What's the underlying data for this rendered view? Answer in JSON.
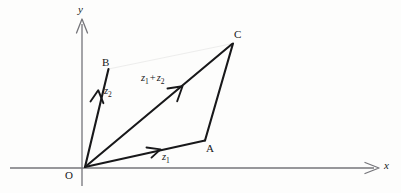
{
  "figure": {
    "kind": "vector-addition-parallelogram-diagram",
    "background_color": "#fdfdfc",
    "ink_color": "#18181a",
    "axis_color": "#6e6e70"
  },
  "axes": {
    "x_label": "x",
    "y_label": "y",
    "origin_label": "O",
    "x_axis": {
      "x1": 10,
      "y1": 168,
      "x2": 374,
      "y2": 168
    },
    "y_axis": {
      "x1": 82,
      "y1": 185,
      "x2": 82,
      "y2": 20
    }
  },
  "points": [
    {
      "id": "O",
      "label": "O",
      "x": 85,
      "y": 167,
      "label_x": 65,
      "label_y": 170
    },
    {
      "id": "A",
      "label": "A",
      "x": 205,
      "y": 140,
      "label_x": 206,
      "label_y": 143
    },
    {
      "id": "B",
      "label": "B",
      "x": 108,
      "y": 70,
      "label_x": 102,
      "label_y": 57
    },
    {
      "id": "C",
      "label": "C",
      "x": 233,
      "y": 43,
      "label_x": 234,
      "label_y": 29
    }
  ],
  "vectors": [
    {
      "id": "z1",
      "label": "z",
      "subscript": "1",
      "from": "O",
      "to": "A",
      "arrow_at": {
        "x": 155,
        "y": 150
      },
      "label_x": 162,
      "label_y": 152
    },
    {
      "id": "z2",
      "label": "z",
      "subscript": "2",
      "from": "O",
      "to": "B",
      "arrow_at": {
        "x": 97,
        "y": 93
      },
      "label_x": 104,
      "label_y": 86
    },
    {
      "id": "z1plusz2",
      "label": "z",
      "subscript": "1",
      "operator": "+",
      "label2": "z",
      "subscript2": "2",
      "from": "O",
      "to": "C",
      "arrow_at": {
        "x": 179,
        "y": 90
      },
      "label_x": 141,
      "label_y": 73
    }
  ],
  "edges": [
    {
      "id": "BC",
      "from": "B",
      "to": "C",
      "style": "solid"
    },
    {
      "id": "AC",
      "from": "A",
      "to": "C",
      "style": "solid"
    }
  ]
}
